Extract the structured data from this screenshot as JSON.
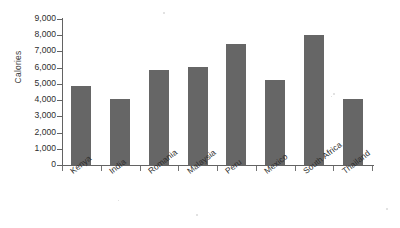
{
  "chart_data": {
    "type": "bar",
    "title": "",
    "subtitle": "",
    "xlabel": "",
    "ylabel": "Calories",
    "categories": [
      "Kenya",
      "India",
      "Romania",
      "Malaysia",
      "Peru",
      "Mexico",
      "South Africa",
      "Thailand"
    ],
    "values": [
      4900,
      4100,
      5850,
      6050,
      7450,
      5250,
      8000,
      4050
    ],
    "ylim": [
      0,
      9000
    ],
    "ytick_step": 1000,
    "ytick_labels": [
      "9,000",
      "8,000",
      "7,000",
      "6,000",
      "5,000",
      "4,000",
      "3,000",
      "2,000",
      "1,000",
      "0"
    ],
    "ytick_values": [
      9000,
      8000,
      7000,
      6000,
      5000,
      4000,
      3000,
      2000,
      1000,
      0
    ],
    "grid": false,
    "legend": false,
    "legend_position": "none",
    "bar_color": "#666666",
    "axis_color": "#636363",
    "background_color": "#ffffff",
    "xtick_label_rotation": -38
  }
}
